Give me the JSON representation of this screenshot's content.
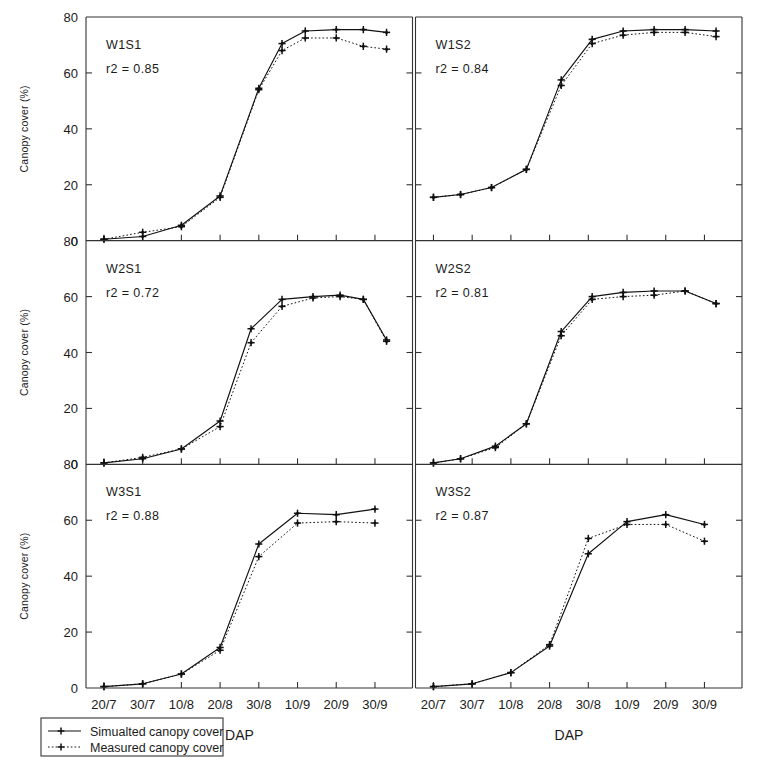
{
  "figure": {
    "title": "",
    "x_axis_title": "DAP",
    "y_axis_title": "Canopy cover (%)",
    "legend": {
      "simulated_label": "Simualted canopy cover",
      "measured_label": "Measured canopy cover"
    },
    "y_ticks": [
      "0",
      "20",
      "40",
      "60",
      "80"
    ],
    "x_ticks": [
      "20/7",
      "30/7",
      "10/8",
      "20/8",
      "30/8",
      "10/9",
      "20/9",
      "30/9"
    ],
    "colors": {
      "axis": "#333333",
      "simulated": "#111111",
      "measured": "#111111",
      "background": "#ffffff"
    }
  },
  "chart_data": {
    "type": "line",
    "title": "",
    "xlabel": "DAP",
    "ylabel": "Canopy cover (%)",
    "ylim": [
      0,
      80
    ],
    "grid": false,
    "legend_position": "bottom-left",
    "categories": [
      "20/7",
      "30/7",
      "10/8",
      "20/8",
      "30/8",
      "10/9",
      "20/9",
      "30/9"
    ],
    "panels": [
      {
        "name": "W1S1",
        "r2_label": "r2 = 0.85",
        "r2": 0.85,
        "row": 0,
        "col": 0,
        "series": [
          {
            "name": "Simualted canopy cover",
            "style": "solid",
            "values": [
              0.5,
              1.5,
              5.5,
              16.0,
              54.5,
              70.5,
              75.0,
              75.5,
              75.5,
              74.5
            ]
          },
          {
            "name": "Measured canopy cover",
            "style": "dotted",
            "values": [
              0.5,
              3.0,
              5.0,
              15.5,
              54.0,
              68.0,
              72.5,
              72.5,
              69.5,
              68.5
            ]
          }
        ],
        "x_positions": [
          0,
          1,
          2,
          3,
          4,
          4.6,
          5.2,
          6.0,
          6.7,
          7.3
        ]
      },
      {
        "name": "W1S2",
        "r2_label": "r2 = 0.84",
        "r2": 0.84,
        "row": 0,
        "col": 1,
        "series": [
          {
            "name": "Simualted canopy cover",
            "style": "solid",
            "values": [
              15.5,
              16.5,
              19.0,
              25.5,
              57.5,
              72.0,
              75.0,
              75.5,
              75.5,
              75.0
            ]
          },
          {
            "name": "Measured canopy cover",
            "style": "dotted",
            "values": [
              15.5,
              16.5,
              19.0,
              25.5,
              55.5,
              70.5,
              73.5,
              74.5,
              74.5,
              73.0
            ]
          }
        ],
        "x_positions": [
          0,
          0.7,
          1.5,
          2.4,
          3.3,
          4.1,
          4.9,
          5.7,
          6.5,
          7.3
        ]
      },
      {
        "name": "W2S1",
        "r2_label": "r2 = 0.72",
        "r2": 0.72,
        "row": 1,
        "col": 0,
        "series": [
          {
            "name": "Simualted canopy cover",
            "style": "solid",
            "values": [
              0.5,
              2.0,
              5.5,
              15.5,
              48.5,
              59.0,
              60.0,
              60.5,
              59.0,
              44.5
            ]
          },
          {
            "name": "Measured canopy cover",
            "style": "dotted",
            "values": [
              0.5,
              2.5,
              5.5,
              13.5,
              43.5,
              56.5,
              59.5,
              60.0,
              59.0,
              44.0
            ]
          }
        ],
        "x_positions": [
          0,
          1,
          2,
          3,
          3.8,
          4.6,
          5.4,
          6.1,
          6.7,
          7.3
        ]
      },
      {
        "name": "W2S2",
        "r2_label": "r2 = 0.81",
        "r2": 0.81,
        "row": 1,
        "col": 1,
        "series": [
          {
            "name": "Simualted canopy cover",
            "style": "solid",
            "values": [
              0.5,
              2.0,
              6.5,
              14.5,
              47.5,
              60.0,
              61.5,
              62.0,
              62.0,
              57.5
            ]
          },
          {
            "name": "Measured canopy cover",
            "style": "dotted",
            "values": [
              0.5,
              2.0,
              6.0,
              14.5,
              46.0,
              59.0,
              60.0,
              60.5,
              62.0,
              57.5
            ]
          }
        ],
        "x_positions": [
          0,
          0.7,
          1.6,
          2.4,
          3.3,
          4.1,
          4.9,
          5.7,
          6.5,
          7.3
        ]
      },
      {
        "name": "W3S1",
        "r2_label": "r2 = 0.88",
        "r2": 0.88,
        "row": 2,
        "col": 0,
        "series": [
          {
            "name": "Simualted canopy cover",
            "style": "solid",
            "values": [
              0.5,
              1.5,
              5.0,
              14.5,
              51.5,
              62.5,
              62.0,
              64.0
            ]
          },
          {
            "name": "Measured canopy cover",
            "style": "dotted",
            "values": [
              0.5,
              1.5,
              5.0,
              13.5,
              47.0,
              59.0,
              59.5,
              59.0
            ]
          }
        ],
        "x_positions": [
          0,
          1,
          2,
          3,
          4,
          5,
          6,
          7
        ]
      },
      {
        "name": "W3S2",
        "r2_label": "r2 = 0.87",
        "r2": 0.87,
        "row": 2,
        "col": 1,
        "series": [
          {
            "name": "Simualted canopy cover",
            "style": "solid",
            "values": [
              0.5,
              1.5,
              5.5,
              15.0,
              48.0,
              59.5,
              62.0,
              58.5
            ]
          },
          {
            "name": "Measured canopy cover",
            "style": "dotted",
            "values": [
              0.5,
              1.5,
              5.5,
              15.5,
              53.5,
              58.5,
              58.5,
              52.5
            ]
          }
        ],
        "x_positions": [
          0,
          1,
          2,
          3,
          4,
          5,
          6,
          7
        ]
      }
    ]
  }
}
